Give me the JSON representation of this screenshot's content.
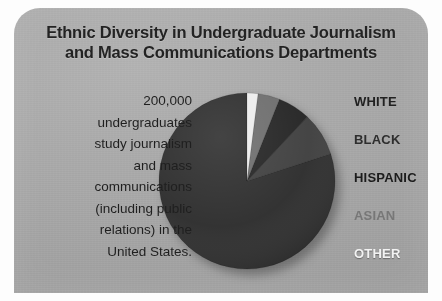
{
  "card": {
    "background_color": "#a9a9a9"
  },
  "title": {
    "line1": "Ethnic Diversity in Undergraduate Journalism",
    "line2": "and Mass Communications Departments",
    "color": "#232323"
  },
  "caption": {
    "line1": "200,000",
    "line2": "undergraduates",
    "line3": "study journalism",
    "line4": "and mass",
    "line5": "communications",
    "line6": "(including public",
    "line7": "relations) in the",
    "line8": "United States.",
    "color": "#1f1f1f"
  },
  "legend": {
    "items": [
      {
        "label": "WHITE",
        "color": "#212121"
      },
      {
        "label": "BLACK",
        "color": "#2e2e2e"
      },
      {
        "label": "HISPANIC",
        "color": "#1c1c1c"
      },
      {
        "label": "ASIAN",
        "color": "#777777"
      },
      {
        "label": "OTHER",
        "color": "#f2f2f2"
      }
    ]
  },
  "chart_data": {
    "type": "pie",
    "title": "Ethnic Diversity in Undergraduate Journalism and Mass Communications Departments",
    "legend_position": "right",
    "categories": [
      "WHITE",
      "BLACK",
      "HISPANIC",
      "ASIAN",
      "OTHER"
    ],
    "values": [
      80,
      8,
      6,
      4,
      2
    ],
    "unit": "percent",
    "colors": [
      "#2f2f2f",
      "#414141",
      "#262626",
      "#6e6e6e",
      "#ededed"
    ],
    "start_angle_deg": 0,
    "direction": "counterclockwise",
    "annotation": "200,000 undergraduates study journalism and mass communications (including public relations) in the United States."
  }
}
